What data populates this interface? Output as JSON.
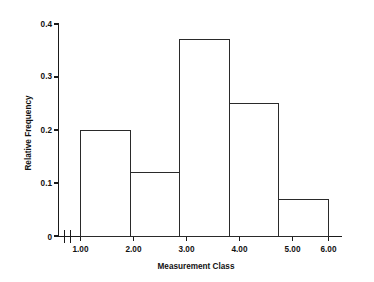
{
  "chart_data": {
    "type": "bar",
    "title": "",
    "subtitle": "",
    "xlabel": "Measurement Class",
    "ylabel": "Relative Frequency",
    "categories": [
      "1.00-2.00",
      "2.00-3.00",
      "3.00-4.00",
      "4.00-5.00",
      "5.00-6.00"
    ],
    "bin_edges": [
      1.0,
      2.0,
      3.0,
      4.0,
      5.0,
      6.0
    ],
    "values": [
      0.2,
      0.12,
      0.37,
      0.25,
      0.07
    ],
    "series": [
      {
        "name": "Relative Frequency",
        "values": [
          0.2,
          0.12,
          0.37,
          0.25,
          0.07
        ]
      }
    ],
    "xlim": [
      1.0,
      6.0
    ],
    "ylim": [
      0.0,
      0.4
    ],
    "xticks": [
      1.0,
      2.0,
      3.0,
      4.0,
      5.0,
      6.0
    ],
    "xtick_labels": [
      "1.00",
      "2.00",
      "3.00",
      "4.00",
      "5.00",
      "6.00"
    ],
    "yticks": [
      0.0,
      0.1,
      0.2,
      0.3,
      0.4
    ],
    "ytick_labels": [
      "0",
      "0.1",
      "0.2",
      "0.3",
      "0.4"
    ],
    "grid": false,
    "legend": null,
    "legend_position": "none",
    "annotations": [
      {
        "name": "x-axis-break",
        "description": "axis break mark between origin and first tick"
      }
    ],
    "bar_fill_color": "#ffffff",
    "bar_edge_color": "#2a2a2a",
    "axis_color": "#1a1a1a",
    "background_color": "#ffffff"
  }
}
